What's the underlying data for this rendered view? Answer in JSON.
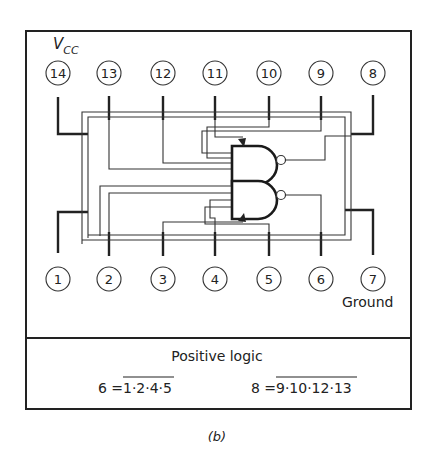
{
  "figure": {
    "vcc_label_main": "V",
    "vcc_label_sub": "CC",
    "ground_label": "Ground",
    "caption": "(b)"
  },
  "pins_top": [
    {
      "number": "14",
      "x": 58
    },
    {
      "number": "13",
      "x": 109
    },
    {
      "number": "12",
      "x": 163
    },
    {
      "number": "11",
      "x": 215
    },
    {
      "number": "10",
      "x": 269
    },
    {
      "number": "9",
      "x": 321
    },
    {
      "number": "8",
      "x": 373
    }
  ],
  "pins_bottom": [
    {
      "number": "1",
      "x": 58
    },
    {
      "number": "2",
      "x": 109
    },
    {
      "number": "3",
      "x": 163
    },
    {
      "number": "4",
      "x": 215
    },
    {
      "number": "5",
      "x": 269
    },
    {
      "number": "6",
      "x": 321
    },
    {
      "number": "7",
      "x": 373
    }
  ],
  "logic": {
    "heading": "Positive logic",
    "eq1_lhs": "6 =",
    "eq1_rhs": "1·2·4·5",
    "eq2_lhs": "8 =",
    "eq2_rhs": "9·10·12·13"
  },
  "gates": [
    {
      "type": "NAND",
      "inputs": [
        "9",
        "10",
        "12",
        "13"
      ],
      "output": "8"
    },
    {
      "type": "NAND",
      "inputs": [
        "1",
        "2",
        "4",
        "5"
      ],
      "output": "6"
    }
  ]
}
